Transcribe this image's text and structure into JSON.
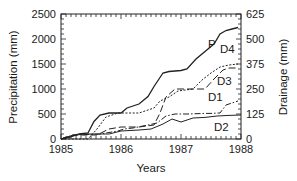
{
  "chart_data": {
    "type": "line",
    "title": "",
    "xlabel": "Years",
    "ylabel": "Precipitation (mm)",
    "y2label": "Drainage (mm)",
    "xlim": [
      1985,
      1988
    ],
    "ylim": [
      0,
      2500
    ],
    "y2lim": [
      0,
      625
    ],
    "x_ticks": [
      "1985",
      "1986",
      "1987",
      "1988"
    ],
    "y_ticks": [
      "0",
      "500",
      "1000",
      "1500",
      "2000",
      "2500"
    ],
    "y2_ticks": [
      "0",
      "125",
      "250",
      "375",
      "500",
      "625"
    ],
    "grid": false,
    "legend": "inline labels",
    "series": [
      {
        "name": "P",
        "axis": "left",
        "style": "solid",
        "label_pos": [
          1987.45,
          1830
        ],
        "points": [
          [
            1985.0,
            0
          ],
          [
            1985.15,
            40
          ],
          [
            1985.3,
            100
          ],
          [
            1985.45,
            120
          ],
          [
            1985.55,
            350
          ],
          [
            1985.65,
            480
          ],
          [
            1985.8,
            520
          ],
          [
            1986.0,
            520
          ],
          [
            1986.1,
            620
          ],
          [
            1986.3,
            700
          ],
          [
            1986.45,
            850
          ],
          [
            1986.55,
            1050
          ],
          [
            1986.7,
            1320
          ],
          [
            1986.8,
            1350
          ],
          [
            1987.0,
            1370
          ],
          [
            1987.1,
            1400
          ],
          [
            1987.25,
            1600
          ],
          [
            1987.45,
            1800
          ],
          [
            1987.55,
            1900
          ],
          [
            1987.65,
            2100
          ],
          [
            1987.75,
            2170
          ],
          [
            1987.85,
            2200
          ],
          [
            1987.95,
            2230
          ]
        ]
      },
      {
        "name": "D1",
        "axis": "right",
        "style": "dash-dot",
        "label_pos": [
          1987.45,
          190
        ],
        "points": [
          [
            1985.0,
            0
          ],
          [
            1985.2,
            20
          ],
          [
            1985.4,
            22
          ],
          [
            1985.65,
            25
          ],
          [
            1985.75,
            30
          ],
          [
            1985.95,
            40
          ],
          [
            1986.05,
            50
          ],
          [
            1986.2,
            55
          ],
          [
            1986.45,
            70
          ],
          [
            1986.6,
            80
          ],
          [
            1986.75,
            115
          ],
          [
            1986.9,
            125
          ],
          [
            1987.1,
            125
          ],
          [
            1987.4,
            128
          ],
          [
            1987.5,
            128
          ],
          [
            1987.65,
            130
          ],
          [
            1987.75,
            170
          ],
          [
            1987.85,
            180
          ],
          [
            1987.95,
            190
          ]
        ]
      },
      {
        "name": "D2",
        "axis": "right",
        "style": "solid",
        "label_pos": [
          1987.55,
          40
        ],
        "points": [
          [
            1985.0,
            0
          ],
          [
            1985.1,
            10
          ],
          [
            1985.25,
            20
          ],
          [
            1985.4,
            25
          ],
          [
            1985.8,
            25
          ],
          [
            1986.0,
            40
          ],
          [
            1986.3,
            45
          ],
          [
            1986.5,
            50
          ],
          [
            1986.7,
            75
          ],
          [
            1986.85,
            100
          ],
          [
            1987.0,
            85
          ],
          [
            1987.2,
            105
          ],
          [
            1987.4,
            108
          ],
          [
            1987.6,
            115
          ],
          [
            1987.8,
            118
          ],
          [
            1988.0,
            120
          ]
        ]
      },
      {
        "name": "D3",
        "axis": "right",
        "style": "long-dash",
        "label_pos": [
          1987.6,
          270
        ],
        "points": [
          [
            1985.0,
            0
          ],
          [
            1985.2,
            20
          ],
          [
            1985.6,
            20
          ],
          [
            1985.8,
            50
          ],
          [
            1986.0,
            60
          ],
          [
            1986.3,
            60
          ],
          [
            1986.55,
            70
          ],
          [
            1986.65,
            130
          ],
          [
            1986.75,
            210
          ],
          [
            1986.9,
            250
          ],
          [
            1987.1,
            250
          ],
          [
            1987.4,
            250
          ],
          [
            1987.55,
            300
          ],
          [
            1987.7,
            345
          ],
          [
            1987.8,
            355
          ],
          [
            1987.95,
            355
          ]
        ]
      },
      {
        "name": "D4",
        "axis": "right",
        "style": "dotted",
        "label_pos": [
          1987.65,
          430
        ],
        "points": [
          [
            1985.0,
            0
          ],
          [
            1985.45,
            0
          ],
          [
            1985.6,
            50
          ],
          [
            1985.75,
            110
          ],
          [
            1985.95,
            130
          ],
          [
            1986.3,
            130
          ],
          [
            1986.55,
            155
          ],
          [
            1986.65,
            190
          ],
          [
            1986.8,
            210
          ],
          [
            1986.95,
            240
          ],
          [
            1987.2,
            250
          ],
          [
            1987.35,
            295
          ],
          [
            1987.5,
            330
          ],
          [
            1987.65,
            360
          ],
          [
            1987.8,
            370
          ],
          [
            1987.95,
            375
          ]
        ]
      }
    ]
  }
}
